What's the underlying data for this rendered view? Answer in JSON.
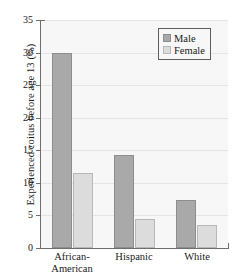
{
  "chart_data": {
    "type": "bar",
    "title": "",
    "subtitle": "",
    "xlabel": "",
    "ylabel": "Experienced coitus before age 13 (%)",
    "ylim": [
      0,
      35
    ],
    "yticks": [
      0,
      5,
      10,
      15,
      20,
      25,
      30,
      35
    ],
    "ytick_labels": [
      "0",
      "5",
      "10",
      "15",
      "20",
      "25",
      "30",
      "35"
    ],
    "grid": true,
    "legend_position": "upper-right",
    "categories": [
      "African-American",
      "Hispanic",
      "White"
    ],
    "category_lines": [
      [
        "African-",
        "American"
      ],
      [
        "Hispanic"
      ],
      [
        "White"
      ]
    ],
    "series": [
      {
        "name": "Male",
        "color": "#a9a9a9",
        "values": [
          29.9,
          14.2,
          7.4
        ]
      },
      {
        "name": "Female",
        "color": "#dcdcdc",
        "values": [
          11.5,
          4.4,
          3.5
        ]
      }
    ]
  },
  "legend": {
    "entries": [
      {
        "label": "Male",
        "swatch": "male-swatch"
      },
      {
        "label": "Female",
        "swatch": "female-swatch"
      }
    ]
  },
  "colors": {
    "male": "#a9a9a9",
    "female": "#dcdcdc",
    "plot_background": "#f7f7f7",
    "gridline": "#e4e4e4",
    "axis": "#6e6e6e",
    "text": "#1a1a1a"
  }
}
